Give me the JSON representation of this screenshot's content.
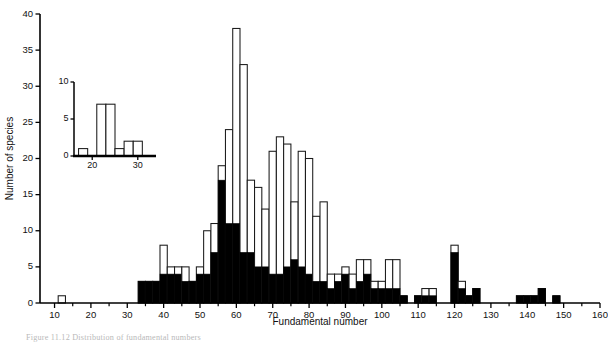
{
  "figure": {
    "caption": "Figure  11.12   Distribution of fundamental numbers"
  },
  "chart_data": {
    "type": "bar",
    "title": "",
    "subtitle": "",
    "xlabel": "Fundamental number",
    "ylabel": "Number of species",
    "xlim": [
      6,
      160
    ],
    "ylim": [
      0,
      40
    ],
    "xticks": [
      10,
      20,
      30,
      40,
      50,
      60,
      70,
      80,
      90,
      100,
      110,
      120,
      130,
      140,
      150,
      160
    ],
    "yticks": [
      0,
      5,
      10,
      15,
      20,
      25,
      30,
      35,
      40
    ],
    "grid": false,
    "legend": [
      {
        "name": "Total (open)",
        "color": "#ffffff",
        "edge": "#1a1a1a"
      },
      {
        "name": "Subset (solid)",
        "color": "#000000",
        "edge": "#000000"
      }
    ],
    "legend_position": "none",
    "bin_width": 2,
    "note": "Stacked histogram: open bar = total height, solid black portion = lower sub-count.",
    "x": [
      12,
      34,
      36,
      38,
      40,
      42,
      44,
      46,
      48,
      50,
      52,
      54,
      56,
      58,
      60,
      62,
      64,
      66,
      68,
      70,
      72,
      74,
      76,
      78,
      80,
      82,
      84,
      86,
      88,
      90,
      92,
      94,
      96,
      98,
      100,
      102,
      104,
      106,
      108,
      110,
      112,
      114,
      116,
      118,
      120,
      122,
      124,
      126,
      128,
      130,
      132,
      134,
      136,
      138,
      140,
      142,
      144,
      146,
      148,
      150
    ],
    "series": [
      {
        "name": "Total",
        "values": [
          1,
          3,
          3,
          3,
          8,
          5,
          5,
          5,
          3,
          5,
          10,
          11,
          19,
          24,
          38,
          33,
          17,
          16,
          13,
          21,
          23,
          22,
          14,
          21,
          20,
          12,
          14,
          4,
          4,
          5,
          4,
          6,
          6,
          3,
          3,
          6,
          6,
          1,
          0,
          1,
          2,
          2,
          0,
          0,
          8,
          3,
          1,
          2,
          0,
          0,
          0,
          0,
          0,
          1,
          1,
          1,
          2,
          0,
          1,
          0
        ]
      },
      {
        "name": "Subset",
        "values": [
          0,
          3,
          3,
          3,
          4,
          4,
          4,
          3,
          3,
          4,
          4,
          7,
          17,
          11,
          11,
          7,
          7,
          5,
          5,
          4,
          4,
          5,
          6,
          5,
          4,
          3,
          3,
          2,
          3,
          4,
          2,
          3,
          4,
          2,
          2,
          2,
          2,
          1,
          0,
          1,
          1,
          1,
          0,
          0,
          7,
          2,
          1,
          2,
          0,
          0,
          0,
          0,
          0,
          1,
          1,
          1,
          2,
          0,
          1,
          0
        ]
      }
    ]
  },
  "inset_chart_data": {
    "type": "bar",
    "xlabel": "",
    "ylabel": "",
    "xlim": [
      16,
      34
    ],
    "ylim": [
      0,
      10
    ],
    "xticks": [
      20,
      30
    ],
    "yticks": [
      0,
      5,
      10
    ],
    "grid": false,
    "bin_width": 2,
    "x": [
      18,
      20,
      22,
      24,
      26,
      28,
      30
    ],
    "values": [
      1,
      0,
      7,
      7,
      1,
      2,
      2
    ]
  }
}
